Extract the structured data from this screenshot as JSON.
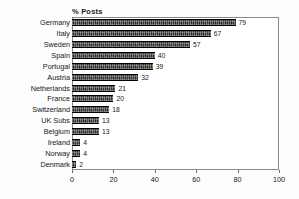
{
  "chart_data": {
    "type": "bar",
    "orientation": "horizontal",
    "title": "% Posts",
    "xlabel": "",
    "ylabel": "",
    "xlim": [
      0,
      100
    ],
    "xticks": [
      0,
      20,
      40,
      60,
      80,
      100
    ],
    "grid": false,
    "legend": false,
    "bar_color": "#2b2b2b",
    "frame_color": "#8a8a8a",
    "categories": [
      "Germany",
      "Italy",
      "Sweden",
      "Spain",
      "Portugal",
      "Austria",
      "Netherlands",
      "France",
      "Switzerland",
      "UK Subs",
      "Belgium",
      "Ireland",
      "Norway",
      "Denmark"
    ],
    "values": [
      79,
      67,
      57,
      40,
      39,
      32,
      21,
      20,
      18,
      13,
      13,
      4,
      4,
      2
    ],
    "value_labels": [
      "79",
      "67",
      "57",
      "40",
      "39",
      "32",
      "21",
      "20",
      "18",
      "13",
      "13",
      "4",
      "4",
      "2"
    ],
    "xtick_labels": [
      "0",
      "20",
      "40",
      "60",
      "80",
      "100"
    ]
  }
}
